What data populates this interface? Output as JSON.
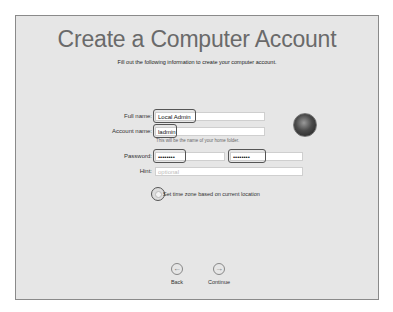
{
  "header": {
    "title": "Create a Computer Account",
    "subtitle": "Fill out the following information to create your computer account."
  },
  "form": {
    "full_name": {
      "label": "Full name:",
      "value": "Local Admin"
    },
    "account_name": {
      "label": "Account name:",
      "value": "ladmin",
      "note": "This will be the name of your home folder."
    },
    "password": {
      "label": "Password:",
      "value": "••••••••",
      "verify_value": "••••••••"
    },
    "hint": {
      "label": "Hint:",
      "placeholder": "optional"
    },
    "timezone_option": {
      "label": "Set time zone based on current location"
    }
  },
  "avatar": {
    "icon": "eagle-user-picture"
  },
  "nav": {
    "back_label": "Back",
    "continue_label": "Continue",
    "back_icon": "←",
    "continue_icon": "→"
  }
}
